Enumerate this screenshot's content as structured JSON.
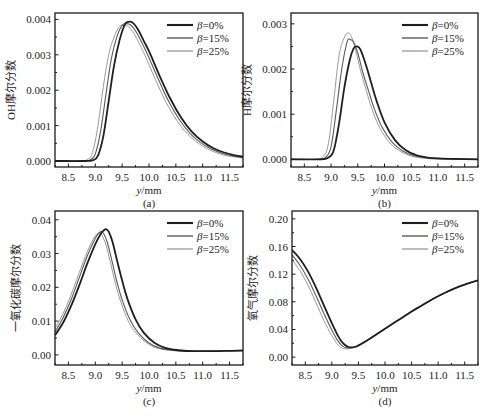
{
  "figure": {
    "width": 491,
    "height": 417
  },
  "series_styles": [
    {
      "name": "β=0%",
      "color": "#1e1e1e",
      "width": 1.8
    },
    {
      "name": "β=15%",
      "color": "#5a5a5a",
      "width": 1.1
    },
    {
      "name": "β=25%",
      "color": "#9a9a9a",
      "width": 1.0
    }
  ],
  "legend": {
    "entries": [
      {
        "symbol": "β",
        "text": "=0%"
      },
      {
        "symbol": "β",
        "text": "=15%"
      },
      {
        "symbol": "β",
        "text": "=25%"
      }
    ]
  },
  "chart_data": [
    {
      "panel": "(a)",
      "type": "line",
      "title": "",
      "xlabel": "y/mm",
      "ylabel": "OH摩尔分数",
      "xlim": [
        8.25,
        11.75
      ],
      "ylim": [
        -0.00017,
        0.00418
      ],
      "xticks": [
        8.5,
        9.0,
        9.5,
        10.0,
        10.5,
        11.0,
        11.5
      ],
      "xtick_labels": [
        "8.5",
        "9.0",
        "9.5",
        "10.0",
        "10.5",
        "11.0",
        "11.5"
      ],
      "yticks": [
        0.0,
        0.001,
        0.002,
        0.003,
        0.004
      ],
      "ytick_labels": [
        "0.000",
        "0.001",
        "0.002",
        "0.003",
        "0.004"
      ],
      "grid": false,
      "legend_position": "upper right",
      "frame": {
        "left": 55,
        "top": 13,
        "right": 243,
        "bottom": 167
      },
      "series": [
        {
          "name": "β=0%",
          "x": [
            8.25,
            8.8,
            8.95,
            9.05,
            9.15,
            9.25,
            9.35,
            9.45,
            9.55,
            9.62,
            9.7,
            9.8,
            9.9,
            10.0,
            10.2,
            10.4,
            10.6,
            10.8,
            11.0,
            11.2,
            11.4,
            11.6,
            11.75
          ],
          "y": [
            0.0,
            0.0,
            2e-05,
            0.00015,
            0.0007,
            0.0017,
            0.0027,
            0.0034,
            0.00385,
            0.00393,
            0.0039,
            0.0037,
            0.0034,
            0.0031,
            0.0024,
            0.00175,
            0.00122,
            0.00082,
            0.00055,
            0.00036,
            0.00024,
            0.00016,
            0.00012
          ]
        },
        {
          "name": "β=15%",
          "x": [
            8.25,
            8.75,
            8.9,
            9.0,
            9.1,
            9.2,
            9.3,
            9.4,
            9.5,
            9.58,
            9.66,
            9.76,
            9.86,
            9.96,
            10.16,
            10.36,
            10.56,
            10.76,
            10.96,
            11.16,
            11.36,
            11.56,
            11.75
          ],
          "y": [
            0.0,
            0.0,
            3e-05,
            0.0002,
            0.00085,
            0.0019,
            0.0029,
            0.0035,
            0.00383,
            0.00388,
            0.00384,
            0.00365,
            0.00336,
            0.00305,
            0.00236,
            0.0017,
            0.00118,
            0.00079,
            0.00052,
            0.00034,
            0.00022,
            0.00014,
            0.0001
          ]
        },
        {
          "name": "β=25%",
          "x": [
            8.25,
            8.7,
            8.85,
            8.95,
            9.05,
            9.15,
            9.25,
            9.35,
            9.45,
            9.54,
            9.62,
            9.72,
            9.82,
            9.92,
            10.12,
            10.32,
            10.52,
            10.72,
            10.92,
            11.12,
            11.32,
            11.52,
            11.75
          ],
          "y": [
            0.0,
            0.0,
            4e-05,
            0.00025,
            0.001,
            0.0021,
            0.003,
            0.0035,
            0.0038,
            0.00383,
            0.00379,
            0.0036,
            0.00331,
            0.003,
            0.0023,
            0.00165,
            0.00114,
            0.00076,
            0.0005,
            0.00032,
            0.0002,
            0.00013,
            9e-05
          ]
        }
      ]
    },
    {
      "panel": "(b)",
      "type": "line",
      "title": "",
      "xlabel": "y/mm",
      "ylabel": "H摩尔分数",
      "xlim": [
        8.25,
        11.75
      ],
      "ylim": [
        -0.00017,
        0.00324
      ],
      "xticks": [
        8.5,
        9.0,
        9.5,
        10.0,
        10.5,
        11.0,
        11.5
      ],
      "xtick_labels": [
        "8.5",
        "9.0",
        "9.5",
        "10.0",
        "10.5",
        "11.0",
        "11.5"
      ],
      "yticks": [
        0.0,
        0.001,
        0.002,
        0.003
      ],
      "ytick_labels": [
        "0.000",
        "0.001",
        "0.002",
        "0.003"
      ],
      "grid": false,
      "legend_position": "upper right",
      "frame": {
        "left": 291,
        "top": 13,
        "right": 478,
        "bottom": 167
      },
      "series": [
        {
          "name": "β=0%",
          "x": [
            8.25,
            8.8,
            8.95,
            9.05,
            9.15,
            9.25,
            9.35,
            9.42,
            9.48,
            9.55,
            9.65,
            9.75,
            9.85,
            10.0,
            10.2,
            10.4,
            10.6,
            10.8,
            11.0,
            11.3,
            11.75
          ],
          "y": [
            0.0,
            0.0,
            4e-05,
            0.0002,
            0.0008,
            0.0016,
            0.0022,
            0.00245,
            0.0025,
            0.00243,
            0.0021,
            0.0017,
            0.0013,
            0.00082,
            0.00042,
            0.0002,
            9e-05,
            4e-05,
            2e-05,
            1e-05,
            0.0
          ]
        },
        {
          "name": "β=15%",
          "x": [
            8.25,
            8.75,
            8.9,
            9.0,
            9.1,
            9.2,
            9.3,
            9.36,
            9.42,
            9.5,
            9.6,
            9.7,
            9.8,
            9.95,
            10.15,
            10.35,
            10.55,
            10.75,
            10.95,
            11.3,
            11.75
          ],
          "y": [
            0.0,
            0.0,
            5e-05,
            0.00028,
            0.0011,
            0.002,
            0.0026,
            0.00265,
            0.0026,
            0.00235,
            0.0019,
            0.00152,
            0.00115,
            0.00072,
            0.00037,
            0.00018,
            8e-05,
            4e-05,
            2e-05,
            1e-05,
            0.0
          ]
        },
        {
          "name": "β=25%",
          "x": [
            8.25,
            8.7,
            8.85,
            8.95,
            9.05,
            9.15,
            9.25,
            9.32,
            9.38,
            9.46,
            9.56,
            9.66,
            9.76,
            9.91,
            10.11,
            10.31,
            10.51,
            10.71,
            10.91,
            11.3,
            11.75
          ],
          "y": [
            0.0,
            0.0,
            6e-05,
            0.00035,
            0.0013,
            0.0023,
            0.0027,
            0.0028,
            0.00272,
            0.00242,
            0.00193,
            0.00152,
            0.00113,
            0.0007,
            0.00035,
            0.00017,
            7e-05,
            3e-05,
            1e-05,
            0.0,
            0.0
          ]
        }
      ]
    },
    {
      "panel": "(c)",
      "type": "line",
      "title": "",
      "xlabel": "y/mm",
      "ylabel": "一氧化碳摩尔分数",
      "xlim": [
        8.25,
        11.75
      ],
      "ylim": [
        -0.003,
        0.0426
      ],
      "xticks": [
        8.5,
        9.0,
        9.5,
        10.0,
        10.5,
        11.0,
        11.5
      ],
      "xtick_labels": [
        "8.5",
        "9.0",
        "9.5",
        "10.0",
        "10.5",
        "11.0",
        "11.5"
      ],
      "yticks": [
        0.0,
        0.01,
        0.02,
        0.03,
        0.04
      ],
      "ytick_labels": [
        "0.00",
        "0.01",
        "0.02",
        "0.03",
        "0.04"
      ],
      "grid": false,
      "legend_position": "upper right",
      "frame": {
        "left": 55,
        "top": 211,
        "right": 243,
        "bottom": 365
      },
      "series": [
        {
          "name": "β=0%",
          "x": [
            8.25,
            8.4,
            8.55,
            8.7,
            8.85,
            9.0,
            9.1,
            9.16,
            9.2,
            9.25,
            9.32,
            9.4,
            9.5,
            9.6,
            9.75,
            9.9,
            10.1,
            10.3,
            10.6,
            10.9,
            11.2,
            11.5,
            11.75
          ],
          "y": [
            0.0058,
            0.0095,
            0.0145,
            0.0205,
            0.027,
            0.0328,
            0.0358,
            0.0369,
            0.0372,
            0.0365,
            0.0335,
            0.0283,
            0.022,
            0.0165,
            0.0105,
            0.0066,
            0.0036,
            0.0021,
            0.0013,
            0.0011,
            0.0011,
            0.0012,
            0.0013
          ]
        },
        {
          "name": "β=15%",
          "x": [
            8.25,
            8.4,
            8.55,
            8.7,
            8.85,
            9.0,
            9.06,
            9.11,
            9.16,
            9.22,
            9.3,
            9.4,
            9.5,
            9.65,
            9.8,
            10.0,
            10.2,
            10.5,
            10.8,
            11.1,
            11.4,
            11.75
          ],
          "y": [
            0.0068,
            0.011,
            0.0163,
            0.0228,
            0.0293,
            0.0345,
            0.036,
            0.0365,
            0.0358,
            0.0335,
            0.0285,
            0.0218,
            0.0163,
            0.0103,
            0.0065,
            0.0035,
            0.002,
            0.0013,
            0.0011,
            0.0011,
            0.0012,
            0.0013
          ]
        },
        {
          "name": "β=25%",
          "x": [
            8.25,
            8.4,
            8.55,
            8.7,
            8.85,
            8.97,
            9.03,
            9.08,
            9.13,
            9.2,
            9.28,
            9.38,
            9.48,
            9.62,
            9.78,
            9.98,
            10.18,
            10.48,
            10.78,
            11.1,
            11.4,
            11.75
          ],
          "y": [
            0.0078,
            0.0122,
            0.0178,
            0.0243,
            0.0305,
            0.0345,
            0.0358,
            0.036,
            0.0352,
            0.0325,
            0.0275,
            0.0208,
            0.0155,
            0.0098,
            0.0061,
            0.0033,
            0.0019,
            0.0012,
            0.0011,
            0.0011,
            0.0012,
            0.0013
          ]
        }
      ]
    },
    {
      "panel": "(d)",
      "type": "line",
      "title": "",
      "xlabel": "y/mm",
      "ylabel": "氧气摩尔分数",
      "xlim": [
        8.25,
        11.75
      ],
      "ylim": [
        -0.0114,
        0.2114
      ],
      "xticks": [
        8.5,
        9.0,
        9.5,
        10.0,
        10.5,
        11.0,
        11.5
      ],
      "xtick_labels": [
        "8.5",
        "9.0",
        "9.5",
        "10.0",
        "10.5",
        "11.0",
        "11.5"
      ],
      "yticks": [
        0.0,
        0.04,
        0.08,
        0.12,
        0.16,
        0.2
      ],
      "ytick_labels": [
        "0.00",
        "0.04",
        "0.08",
        "0.12",
        "0.16",
        "0.20"
      ],
      "grid": false,
      "legend_position": "upper right",
      "frame": {
        "left": 292,
        "top": 211,
        "right": 478,
        "bottom": 365
      },
      "series": [
        {
          "name": "β=0%",
          "x": [
            8.25,
            8.4,
            8.55,
            8.7,
            8.85,
            9.0,
            9.1,
            9.2,
            9.3,
            9.38,
            9.45,
            9.55,
            9.7,
            9.9,
            10.1,
            10.3,
            10.5,
            10.7,
            10.9,
            11.1,
            11.3,
            11.5,
            11.75
          ],
          "y": [
            0.155,
            0.142,
            0.124,
            0.101,
            0.075,
            0.049,
            0.033,
            0.021,
            0.015,
            0.014,
            0.015,
            0.019,
            0.026,
            0.036,
            0.046,
            0.056,
            0.066,
            0.075,
            0.084,
            0.092,
            0.099,
            0.105,
            0.111
          ]
        },
        {
          "name": "β=15%",
          "x": [
            8.25,
            8.4,
            8.55,
            8.7,
            8.85,
            9.0,
            9.1,
            9.2,
            9.28,
            9.36,
            9.45,
            9.55,
            9.7,
            9.9,
            10.1,
            10.3,
            10.5,
            10.7,
            10.9,
            11.1,
            11.3,
            11.5,
            11.75
          ],
          "y": [
            0.148,
            0.133,
            0.113,
            0.089,
            0.063,
            0.039,
            0.025,
            0.016,
            0.0135,
            0.0135,
            0.015,
            0.019,
            0.026,
            0.036,
            0.046,
            0.056,
            0.066,
            0.075,
            0.084,
            0.092,
            0.099,
            0.105,
            0.111
          ]
        },
        {
          "name": "β=25%",
          "x": [
            8.25,
            8.4,
            8.55,
            8.7,
            8.85,
            9.0,
            9.1,
            9.18,
            9.26,
            9.34,
            9.45,
            9.55,
            9.7,
            9.9,
            10.1,
            10.3,
            10.5,
            10.7,
            10.9,
            11.1,
            11.3,
            11.5,
            11.75
          ],
          "y": [
            0.141,
            0.125,
            0.104,
            0.079,
            0.053,
            0.031,
            0.019,
            0.0135,
            0.012,
            0.0125,
            0.015,
            0.019,
            0.026,
            0.036,
            0.046,
            0.056,
            0.066,
            0.075,
            0.084,
            0.092,
            0.099,
            0.105,
            0.111
          ]
        }
      ]
    }
  ]
}
